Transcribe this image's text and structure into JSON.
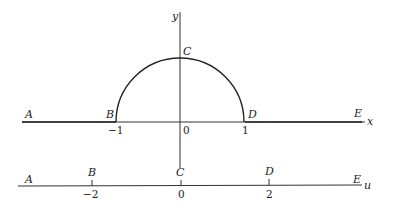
{
  "diagram": {
    "upper": {
      "axis_x_label": "x",
      "axis_y_label": "y",
      "points": {
        "A": "A",
        "B": "B",
        "C": "C",
        "D": "D",
        "E": "E"
      },
      "ticks": [
        "−1",
        "0",
        "1"
      ]
    },
    "lower": {
      "axis_label": "u",
      "points": {
        "A": "A",
        "B": "B",
        "C": "C",
        "D": "D",
        "E": "E"
      },
      "ticks": [
        "−2",
        "0",
        "2"
      ]
    },
    "colors": {
      "stroke": "#222222",
      "background": "#ffffff"
    }
  }
}
